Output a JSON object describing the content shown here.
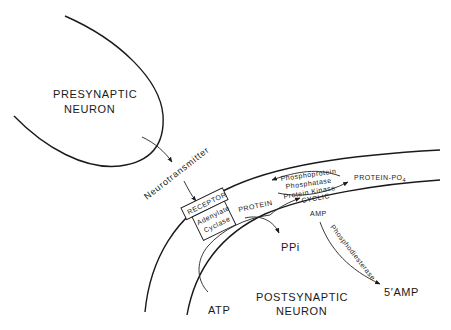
{
  "diagram": {
    "nodes": {
      "presynaptic_line1": "PRESYNAPTIC",
      "presynaptic_line2": "NEURON",
      "neurotransmitter": "Neurotransmitter",
      "receptor": "RECEPTOR",
      "adenylate": "Adenylate",
      "cyclase": "Cyclase",
      "protein": "PROTEIN",
      "phosphoprotein": "Phosphoprotein",
      "phosphatase": "Phosphatase",
      "protein_kinase": "Protein Kinase",
      "protein_po4": "PROTEIN-PO",
      "protein_po4_sub": "4",
      "cyclic": "CYCLIC",
      "amp": "AMP",
      "ppi": "PPi",
      "phosphodiesterase": "Phosphodiesterase",
      "five_amp": "5′AMP",
      "atp": "ATP",
      "postsynaptic_line1": "POSTSYNAPTIC",
      "postsynaptic_line2": "NEURON"
    },
    "edges": [
      {
        "from": "presynaptic neuron",
        "to": "receptor",
        "label": "Neurotransmitter"
      },
      {
        "from": "ATP",
        "to": "cyclic AMP",
        "via": "Adenylate Cyclase"
      },
      {
        "from": "ATP",
        "to": "PPi",
        "via": "Adenylate Cyclase"
      },
      {
        "from": "PROTEIN",
        "to": "PROTEIN-PO4",
        "label": "Protein Kinase"
      },
      {
        "from": "PROTEIN-PO4",
        "to": "PROTEIN",
        "label": "Phosphoprotein Phosphatase"
      },
      {
        "from": "cyclic AMP",
        "to": "5'AMP",
        "label": "Phosphodiesterase"
      }
    ]
  }
}
